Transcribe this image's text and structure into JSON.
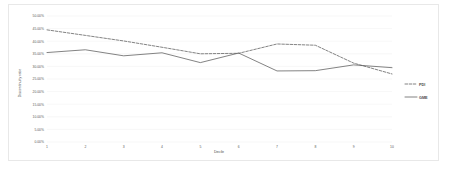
{
  "chart_data": {
    "type": "line",
    "title": "",
    "xlabel": "Decile",
    "ylabel": "Discontinuity ratio",
    "categories": [
      "1",
      "2",
      "3",
      "4",
      "5",
      "6",
      "7",
      "8",
      "9",
      "10"
    ],
    "x": [
      1,
      2,
      3,
      4,
      5,
      6,
      7,
      8,
      9,
      10
    ],
    "ylim": [
      0,
      50
    ],
    "xlim": [
      1,
      10
    ],
    "y_tick_labels": [
      "50.00%",
      "45.00%",
      "40.00%",
      "35.00%",
      "30.00%",
      "25.00%",
      "20.00%",
      "15.00%",
      "10.00%",
      "5.00%",
      "0.00%"
    ],
    "y_tick_values": [
      50,
      45,
      40,
      35,
      30,
      25,
      20,
      15,
      10,
      5,
      0
    ],
    "x_tick_labels": [
      "1",
      "2",
      "3",
      "4",
      "5",
      "6",
      "7",
      "8",
      "9",
      "10"
    ],
    "grid": true,
    "grid_axis": "y",
    "legend_position": "right",
    "series": [
      {
        "name": "PDI",
        "style": "dashed",
        "color": "#595959",
        "values": [
          44.5,
          42.3,
          40.1,
          37.6,
          35.0,
          35.2,
          38.9,
          38.4,
          31.3,
          27.0
        ]
      },
      {
        "name": "GME",
        "style": "solid",
        "color": "#595959",
        "values": [
          35.5,
          36.6,
          34.2,
          35.4,
          31.5,
          35.3,
          28.2,
          28.3,
          30.6,
          29.5
        ]
      }
    ]
  },
  "legend": {
    "items": [
      {
        "label": "PDI",
        "style": "dashed"
      },
      {
        "label": "GME",
        "style": "solid"
      }
    ]
  },
  "axes": {
    "x_title": "Decile",
    "y_title": "Discontinuity ratio"
  }
}
